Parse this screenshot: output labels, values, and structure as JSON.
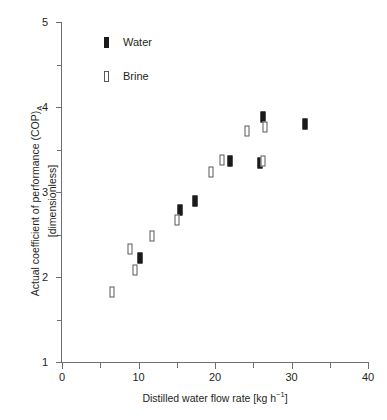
{
  "chart_data": {
    "type": "scatter",
    "title": "",
    "xlabel": "Distilled water flow rate [kg h⁻¹]",
    "ylabel_line1": "Actual coefficient of performance (COP)",
    "ylabel_sub": "A",
    "ylabel_line2": "[dimensionless]",
    "xlim": [
      0,
      40
    ],
    "ylim": [
      1,
      5
    ],
    "xticks": [
      0,
      10,
      20,
      30,
      40
    ],
    "xtick_labels": [
      "0",
      "10",
      "20",
      "30",
      "40"
    ],
    "xminor_ticks": [
      5,
      15,
      25,
      35
    ],
    "yticks": [
      1,
      2,
      3,
      4,
      5
    ],
    "ytick_labels": [
      "1",
      "2",
      "3",
      "4",
      "5"
    ],
    "yminor_ticks": [
      1.5,
      2.5,
      3.5,
      4.5
    ],
    "grid": false,
    "legend_position": "upper left inside",
    "series": [
      {
        "name": "Water",
        "marker": "filled-vertical-bar",
        "color": "#1a1a1a",
        "points": [
          {
            "x": 10.2,
            "y": 2.22
          },
          {
            "x": 15.4,
            "y": 2.79
          },
          {
            "x": 17.4,
            "y": 2.89
          },
          {
            "x": 22.0,
            "y": 3.36
          },
          {
            "x": 25.9,
            "y": 3.34
          },
          {
            "x": 26.3,
            "y": 3.88
          },
          {
            "x": 31.8,
            "y": 3.8
          }
        ]
      },
      {
        "name": "Brine",
        "marker": "open-vertical-bar",
        "color": "#58595b",
        "points": [
          {
            "x": 6.6,
            "y": 1.82
          },
          {
            "x": 8.9,
            "y": 2.33
          },
          {
            "x": 9.6,
            "y": 2.08
          },
          {
            "x": 11.7,
            "y": 2.48
          },
          {
            "x": 15.0,
            "y": 2.67
          },
          {
            "x": 19.5,
            "y": 3.23
          },
          {
            "x": 20.9,
            "y": 3.38
          },
          {
            "x": 24.2,
            "y": 3.72
          },
          {
            "x": 26.3,
            "y": 3.37
          },
          {
            "x": 26.5,
            "y": 3.76
          }
        ]
      }
    ]
  },
  "legend": {
    "items": [
      {
        "label": "Water",
        "key": "water"
      },
      {
        "label": "Brine",
        "key": "brine"
      }
    ]
  },
  "colors": {
    "water": "#1a1a1a",
    "brine": "#58595b",
    "axis": "#6d6e71",
    "text": "#231f20",
    "background": "#ffffff"
  }
}
